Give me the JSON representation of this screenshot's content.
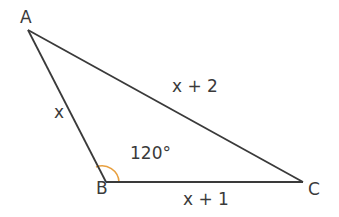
{
  "diagram": {
    "type": "triangle",
    "vertices": {
      "A": {
        "label": "A"
      },
      "B": {
        "label": "B"
      },
      "C": {
        "label": "C"
      }
    },
    "sides": {
      "AB": {
        "label": "x"
      },
      "AC": {
        "label": "x + 2"
      },
      "BC": {
        "label": "x + 1"
      }
    },
    "angle_B": {
      "label": "120°",
      "color": "#e8a040"
    },
    "line_color": "#3a3a3a"
  }
}
